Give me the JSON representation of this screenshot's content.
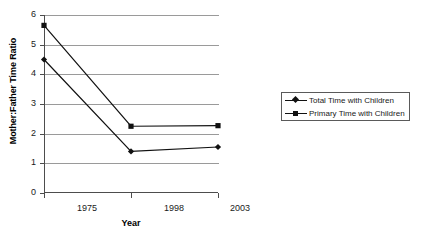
{
  "chart_data": {
    "type": "line",
    "title": "",
    "xlabel": "Year",
    "ylabel": "Mother:Father Time Ratio",
    "categories": [
      "1975",
      "1998",
      "2003"
    ],
    "ylim": [
      0,
      6
    ],
    "yticks": [
      "0",
      "1",
      "2",
      "3",
      "4",
      "5",
      "6"
    ],
    "grid": true,
    "legend_position": "right",
    "series": [
      {
        "name": "Total Time with Children",
        "marker": "diamond",
        "color": "#111111",
        "values": [
          4.5,
          1.4,
          1.55
        ]
      },
      {
        "name": "Primary Time with Children",
        "marker": "square",
        "color": "#111111",
        "values": [
          5.65,
          2.25,
          2.27
        ]
      }
    ]
  },
  "axes": {
    "y_title": "Mother:Father Time Ratio",
    "x_title": "Year",
    "y_tick_labels": [
      "6",
      "5",
      "4",
      "3",
      "2",
      "1",
      "0"
    ],
    "x_tick_labels": [
      "1975",
      "1998",
      "2003"
    ]
  },
  "legend": {
    "entries": [
      {
        "label": "Total Time with Children",
        "marker": "diamond"
      },
      {
        "label": "Primary Time with Children",
        "marker": "square"
      }
    ]
  },
  "colors": {
    "gridline": "#9a9a9a",
    "axis": "#4d4d4d",
    "series": "#111111",
    "legend_border": "#5a5a5a",
    "background": "#ffffff"
  }
}
